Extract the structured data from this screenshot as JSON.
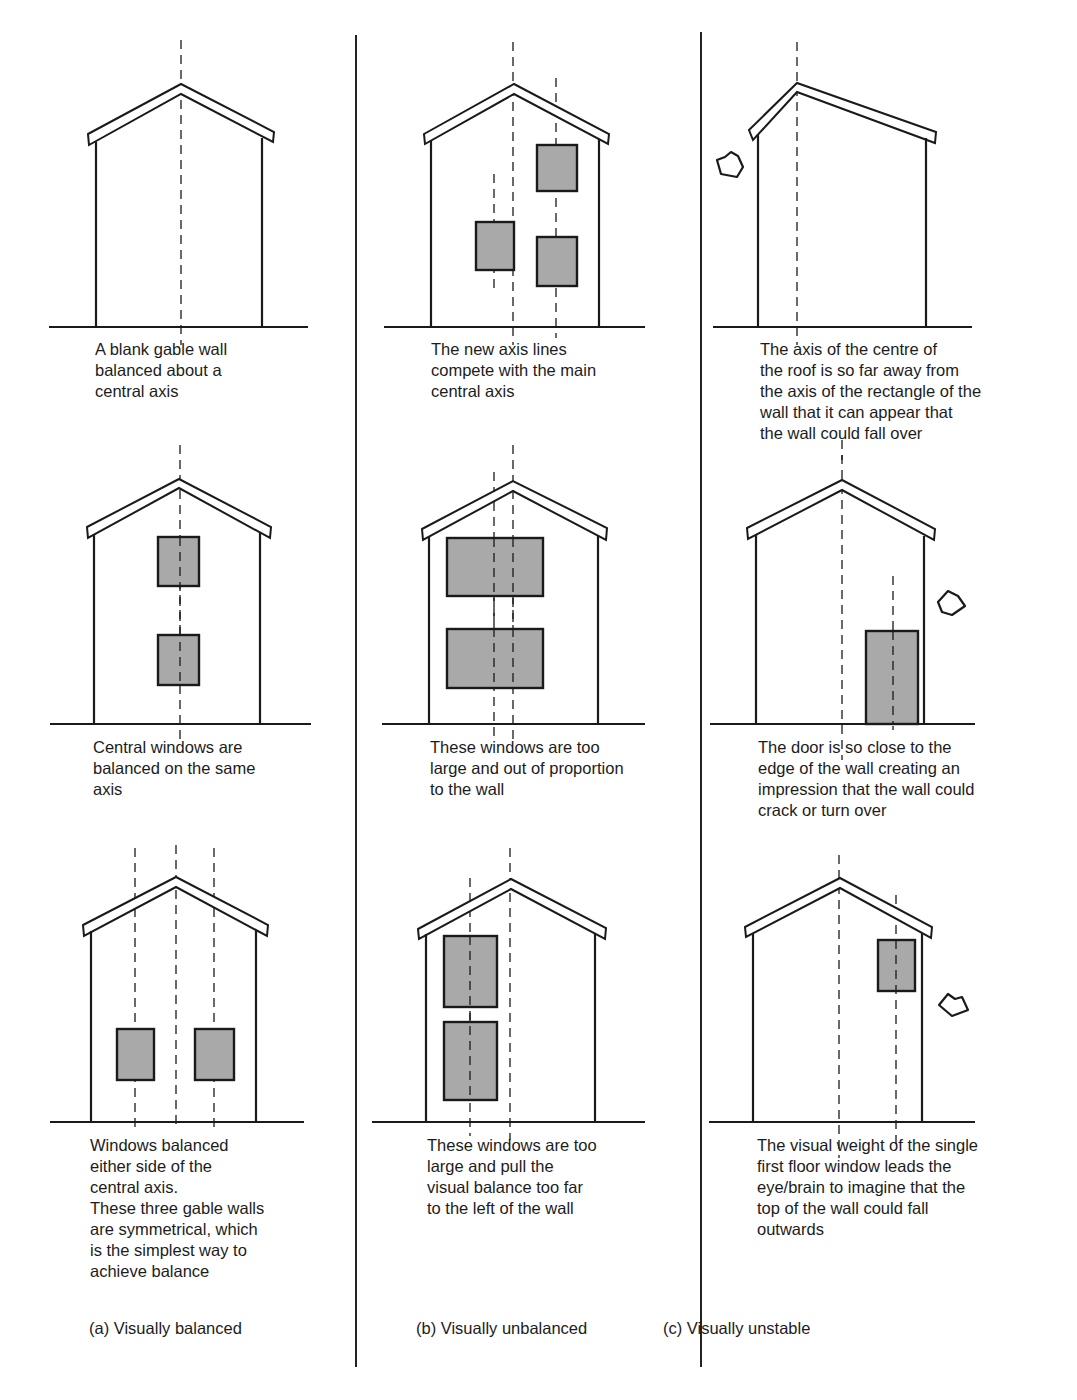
{
  "figure": {
    "columns": [
      {
        "id": "a",
        "label": "(a) Visually balanced",
        "panels": [
          {
            "caption": "A blank gable wall\nbalanced about a\ncentral axis"
          },
          {
            "caption": "Central windows are\nbalanced on the same\naxis"
          },
          {
            "caption": "Windows balanced\neither side of the\ncentral axis.\nThese three gable walls\nare symmetrical, which\nis the simplest way to\nachieve balance"
          }
        ]
      },
      {
        "id": "b",
        "label": "(b) Visually unbalanced",
        "panels": [
          {
            "caption": "The new axis lines\ncompete with the main\ncentral axis"
          },
          {
            "caption": "These windows are too\nlarge and out of proportion\nto the wall"
          },
          {
            "caption": "These windows are too\nlarge and pull the\nvisual balance too far\nto the left of the wall"
          }
        ]
      },
      {
        "id": "c",
        "label": "(c) Visually unstable",
        "panels": [
          {
            "caption": "The axis of the centre of\nthe roof is so far away from\nthe axis of the rectangle of the\nwall that it can appear that\nthe wall could fall over"
          },
          {
            "caption": "The door is so close to the\nedge of the wall creating an\nimpression that the wall could\ncrack or turn over"
          },
          {
            "caption": "The visual weight of the single\nfirst floor window leads the\neye/brain to imagine that the\ntop of the wall could fall\noutwards"
          }
        ]
      }
    ],
    "colors": {
      "line": "#1a1a1a",
      "window_fill": "#a9a9a9",
      "background": "#ffffff"
    },
    "icons": [
      "tipping-arrow-icon",
      "tipping-arrow-icon",
      "tipping-arrow-icon"
    ]
  }
}
